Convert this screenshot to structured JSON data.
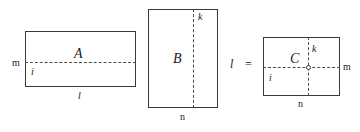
{
  "figure": {
    "type": "tensor-contraction-diagram",
    "ink_color": "#3a3a3a",
    "dash_color": "#4a4a4a",
    "background": "#ffffff",
    "operator": "=",
    "blocks": [
      {
        "id": "A",
        "label": "A",
        "orientation": "landscape",
        "labels": {
          "left": "m",
          "inner_below_dash": "i",
          "bottom": "l"
        }
      },
      {
        "id": "B",
        "label": "B",
        "orientation": "portrait",
        "labels": {
          "top": "k",
          "bottom": "n"
        }
      },
      {
        "id": "C",
        "label": "C",
        "orientation": "landscape",
        "labels": {
          "top": "k",
          "right": "m",
          "inner_below_dash": "i",
          "bottom": "n"
        }
      }
    ]
  },
  "labels": {
    "block_a": "A",
    "block_b": "B",
    "block_c": "C",
    "a_left_m": "m",
    "a_inner_i": "i",
    "a_bottom_l": "l",
    "b_top_k": "k",
    "b_bottom_n": "n",
    "middle_l": "l",
    "equals": "=",
    "c_top_k": "k",
    "c_right_m": "m",
    "c_inner_i": "i",
    "c_bottom_n": "n"
  }
}
